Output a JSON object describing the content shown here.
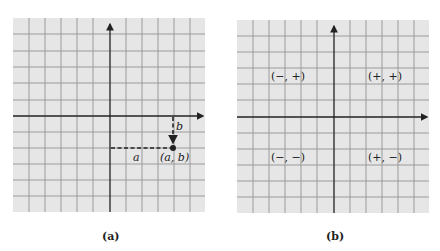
{
  "figure": {
    "panels": [
      {
        "id": "a",
        "caption": "(a)",
        "labels": {
          "horizontal_distance": "a",
          "vertical_distance": "b",
          "point": "(a, b)"
        }
      },
      {
        "id": "b",
        "caption": "(b)",
        "quadrants": {
          "q2": "(−, +)",
          "q1": "(+, +)",
          "q3": "(−, −)",
          "q4": "(+, −)"
        }
      }
    ],
    "colors": {
      "grid_background": "#e6e6e6",
      "grid_line": "#9a9a9a",
      "axis": "#222222"
    }
  }
}
